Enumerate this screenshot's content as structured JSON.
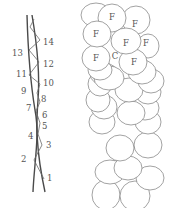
{
  "left_panel": {
    "description": "Two twisting strands with zigzag cross-links, numbered nodes",
    "labels": [
      {
        "id": "1",
        "text": "1"
      },
      {
        "id": "2",
        "text": "2"
      },
      {
        "id": "3",
        "text": "3"
      },
      {
        "id": "4",
        "text": "4"
      },
      {
        "id": "5",
        "text": "5"
      },
      {
        "id": "6",
        "text": "6"
      },
      {
        "id": "7",
        "text": "7"
      },
      {
        "id": "8",
        "text": "8"
      },
      {
        "id": "9",
        "text": "9"
      },
      {
        "id": "10",
        "text": "10"
      },
      {
        "id": "11",
        "text": "11"
      },
      {
        "id": "12",
        "text": "12"
      },
      {
        "id": "13",
        "text": "13"
      },
      {
        "id": "14",
        "text": "14"
      }
    ]
  },
  "right_panel": {
    "description": "Column of overlapping ellipses (cells)",
    "cell_labels": {
      "f": "F",
      "c": "C"
    }
  },
  "colors": {
    "stroke": "#4a4a4a",
    "text": "#555555",
    "cell_stroke": "#7a7a7a",
    "background": "#ffffff"
  }
}
